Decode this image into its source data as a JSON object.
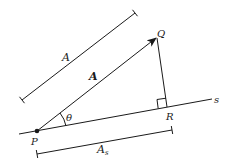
{
  "diagram": {
    "labels": {
      "length_A": "A",
      "vector_A": "A",
      "point_P": "P",
      "point_Q": "Q",
      "point_R": "R",
      "line_s": "s",
      "angle": "θ",
      "projection_main": "A",
      "projection_sub": "s"
    },
    "colors": {
      "stroke": "#1a1a1a",
      "background": "#ffffff"
    }
  }
}
